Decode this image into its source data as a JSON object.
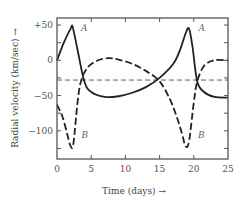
{
  "chart_data": {
    "type": "line",
    "title": "",
    "xlabel": "Time (days) →",
    "ylabel": "Radial velocity (km/sec) →",
    "xlim": [
      0,
      25
    ],
    "ylim": [
      -140,
      60
    ],
    "xticks": [
      0,
      5,
      10,
      15,
      20,
      25
    ],
    "xtick_labels": [
      "0",
      "5",
      "10",
      "15",
      "20",
      "25"
    ],
    "yticks": [
      50,
      25,
      0,
      -25,
      -50,
      -75,
      -100,
      -125
    ],
    "ytick_labels": [
      {
        "value": 50,
        "label": "+50"
      },
      {
        "value": 0,
        "label": "0"
      },
      {
        "value": -50,
        "label": "−50"
      },
      {
        "value": -100,
        "label": "−100"
      }
    ],
    "grid": false,
    "legend": "inline labels",
    "gamma_velocity": -28,
    "series": [
      {
        "name": "A",
        "style": "solid",
        "x": [
          0,
          1,
          2,
          2.3,
          3,
          4,
          5,
          7,
          9,
          11,
          13,
          15,
          17,
          18,
          18.8,
          19.3,
          19.8,
          20.5,
          21.5,
          23,
          25
        ],
        "y": [
          0,
          25,
          45,
          47,
          15,
          -30,
          -45,
          -52,
          -51,
          -46,
          -38,
          -25,
          -5,
          15,
          38,
          45,
          20,
          -30,
          -45,
          -52,
          -53
        ]
      },
      {
        "name": "B",
        "style": "dashed",
        "x": [
          0,
          0.8,
          1.5,
          2,
          2.4,
          3,
          3.5,
          4.5,
          6,
          7.5,
          9,
          11,
          13,
          15,
          16.5,
          17.5,
          18.3,
          18.8,
          19.3,
          20,
          20.5,
          21.5,
          23,
          25
        ],
        "y": [
          -63,
          -80,
          -105,
          -122,
          -118,
          -60,
          -30,
          -10,
          0,
          3,
          1,
          -5,
          -15,
          -30,
          -55,
          -80,
          -105,
          -122,
          -115,
          -60,
          -30,
          -8,
          0,
          0
        ]
      }
    ],
    "annotations": [
      {
        "text": "A",
        "x": 3.5,
        "y": 42
      },
      {
        "text": "B",
        "x": 3.6,
        "y": -110
      },
      {
        "text": "A",
        "x": 20.7,
        "y": 42
      },
      {
        "text": "B",
        "x": 20.6,
        "y": -110
      }
    ]
  }
}
